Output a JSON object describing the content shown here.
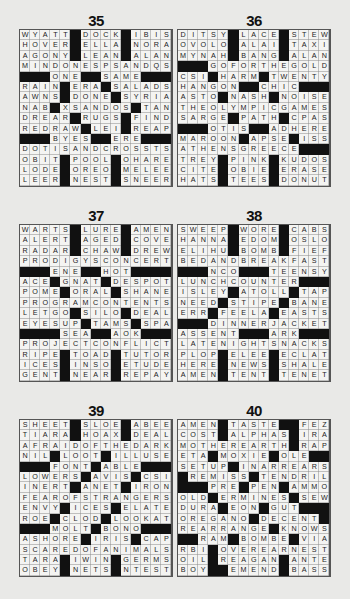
{
  "page": {
    "background": "#e9e9e7",
    "black_square_color": "#111111",
    "cell_color": "#f4f4f2"
  },
  "puzzles": [
    {
      "number": "35",
      "rows": [
        "WYATT#DOCK#IBIS",
        "HOVER#ELLA#NORA",
        "AGONY#LEAN#ALAN",
        "MINDONESPSANDQS",
        "###ONE##SAME###",
        "RAIN#ERA#SALADS",
        "AWNS#DONE#SYRIA",
        "NAB#XSANDOS#TAN",
        "DREAR#RUGS#FIND",
        "REDRAW#LEI#REAP",
        "###BYES##ERE###",
        "DOTISANDCROSSTS",
        "OBIT#POOL#OHARE",
        "LODE#OREO#MELEE",
        "LEER#NEST#SNEER"
      ]
    },
    {
      "number": "36",
      "rows": [
        "DITSY#LACE#STEW",
        "OVOLO#ALAI#TAXI",
        "MYNAH#BANG#ALAN",
        "###GOFORTHEGOLD",
        "CSI#HARM#TWENTY",
        "HANGON##CHIC###",
        "ASTO#NASH#NOISE",
        "THEOLYMPICGAMES",
        "SARGE#PATH#CPAS",
        "###OTIS##ADHERE",
        "MAROON#APSE#ISS",
        "ATHENSGREECE###",
        "TREY#PINK#KUDOS",
        "CITE#OBIE#ERASE",
        "HATS#TEES#DONUT"
      ]
    },
    {
      "number": "37",
      "rows": [
        "WARTS#LURE#AMEN",
        "ALERT#AGED#COVE",
        "RADAR#CHAW#DREW",
        "PRODIGYSCONCERT",
        "###ENE##HOT####",
        "ACE#GNAT#DESPOT",
        "POME#ORAL#SHANE",
        "PROGRAMCONTENTS",
        "LETGO#SILO#DEAL",
        "EYESUP#TAMS#SPA",
        "####SEA##AOK###",
        "PROJECTCONFLICT",
        "RIPE#TOAD#TUTOR",
        "ICES#INSO#ETUDE",
        "GENT#NEAR#REPAY"
      ]
    },
    {
      "number": "38",
      "rows": [
        "SWEEP#WORE#CABS",
        "HANNA#EDOM#OSLO",
        "ELIHU#BOMB#FIEF",
        "BEDANDBREAKFAST",
        "###NCO###TEENSY",
        "LUNCHCOUNTER###",
        "ISLEY#ATOLL#TAP",
        "NEED#STIPE#BANE",
        "ERR#FEELA#EASTS",
        "###DINNERJACKET",
        "ASSENT###ARK###",
        "LATENIGHTSNACKS",
        "PLOP#ELEE#ECLAT",
        "HERE#NEWS#SHALE",
        "AMEN#TENT#TENET"
      ]
    },
    {
      "number": "39",
      "rows": [
        "SHEET#SLOE#ABEE",
        "TIARA#HOAX#DEAL",
        "AFRAIDOFTHEDARK",
        "NIL#LOOT#ILLUSE",
        "###FONT#ABLE###",
        "LOWERS#AVIS#CSI",
        "INERT#ANET#IRON",
        "FEAROFSTRANGERS",
        "ENVY#ICES#ELATE",
        "ROE#CLOD#LOOKAT",
        "###MOLT#BONO###",
        "ASHORE#IRIS#CAP",
        "SCAREDOFANIMALS",
        "TARA#IWIN#GERMS",
        "OBEY#NETS#NTEST"
      ]
    },
    {
      "number": "40",
      "rows": [
        "AMEN#TASTE##FEZ",
        "COST#ALPHAS#IRA",
        "MOTHEREARTH#RAP",
        "ETA#MOXIE#OLE##",
        "SETUP#INARREARS",
        "#REMISS#TENDRIL",
        "###PRE#PEN#AMMO",
        "OLD#ERMINES#SEW",
        "DURA#EON#GUT###",
        "OREGANO#DECENT#",
        "REARRANGE#KNOWS",
        "##RAM#BOMBE#VIA",
        "RBI#OVEREARNEST",
        "OIL#REAGAN#ANTE",
        "BOY##EMEND#BASS"
      ]
    }
  ]
}
